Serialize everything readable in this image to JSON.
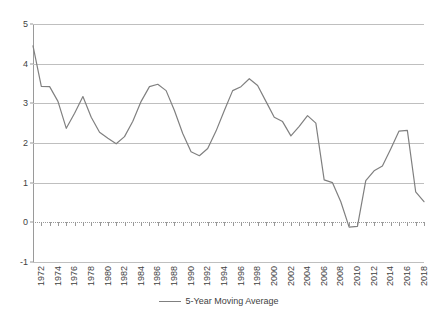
{
  "chart_data": {
    "type": "line",
    "title": "",
    "xlabel": "",
    "ylabel": "",
    "ylim": [
      -1,
      5
    ],
    "y_ticks": [
      5,
      4,
      3,
      2,
      1,
      0,
      -1
    ],
    "grid": true,
    "legend_position": "bottom",
    "x_tick_step": 2,
    "x_tick_labels": [
      "1972",
      "1974",
      "1976",
      "1978",
      "1980",
      "1982",
      "1984",
      "1986",
      "1988",
      "1990",
      "1992",
      "1994",
      "1996",
      "1998",
      "2000",
      "2002",
      "2004",
      "2006",
      "2008",
      "2010",
      "2012",
      "2014",
      "2016",
      "2018"
    ],
    "series": [
      {
        "name": "5-Year Moving Average",
        "color": "#808080",
        "x": [
          1972,
          1973,
          1974,
          1975,
          1976,
          1977,
          1978,
          1979,
          1980,
          1981,
          1982,
          1983,
          1984,
          1985,
          1986,
          1987,
          1988,
          1989,
          1990,
          1991,
          1992,
          1993,
          1994,
          1995,
          1996,
          1997,
          1998,
          1999,
          2000,
          2001,
          2002,
          2003,
          2004,
          2005,
          2006,
          2007,
          2008,
          2009,
          2010,
          2011,
          2012,
          2013,
          2014,
          2015,
          2016,
          2017,
          2018,
          2019
        ],
        "values": [
          4.45,
          3.43,
          3.42,
          3.05,
          2.37,
          2.75,
          3.17,
          2.65,
          2.27,
          2.12,
          1.98,
          2.16,
          2.55,
          3.05,
          3.42,
          3.48,
          3.32,
          2.82,
          2.24,
          1.78,
          1.68,
          1.86,
          2.3,
          2.82,
          3.32,
          3.42,
          3.62,
          3.45,
          3.05,
          2.65,
          2.54,
          2.18,
          2.42,
          2.69,
          2.5,
          1.07,
          1.0,
          0.52,
          -0.12,
          -0.1,
          1.05,
          1.3,
          1.42,
          1.85,
          2.3,
          2.32,
          0.77,
          0.52
        ]
      }
    ]
  },
  "legend": {
    "label": "5-Year Moving Average"
  }
}
